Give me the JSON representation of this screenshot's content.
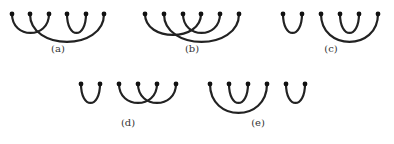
{
  "diagrams": [
    {
      "label": "(a)",
      "dots_x": [
        12,
        30,
        49,
        67,
        86,
        104
      ],
      "y": 14,
      "arcs": [
        [
          0,
          2,
          33
        ],
        [
          1,
          5,
          42
        ],
        [
          3,
          4,
          33
        ]
      ],
      "label_x": 58,
      "label_y": 50
    },
    {
      "label": "(b)",
      "dots_x": [
        145,
        164,
        183,
        201,
        220,
        239
      ],
      "y": 14,
      "arcs": [
        [
          0,
          3,
          35
        ],
        [
          2,
          4,
          33
        ],
        [
          1,
          5,
          42
        ]
      ],
      "label_x": 192,
      "label_y": 50
    },
    {
      "label": "(c)",
      "dots_x": [
        283,
        302,
        321,
        340,
        359,
        378
      ],
      "y": 14,
      "arcs": [
        [
          0,
          1,
          33
        ],
        [
          2,
          5,
          42
        ],
        [
          3,
          4,
          33
        ]
      ],
      "label_x": 331,
      "label_y": 50
    },
    {
      "label": "(d)",
      "dots_x": [
        81,
        100,
        119,
        138,
        157,
        176
      ],
      "y": 84,
      "arcs": [
        [
          0,
          1,
          103
        ],
        [
          2,
          4,
          103
        ],
        [
          3,
          5,
          103
        ]
      ],
      "label_x": 128,
      "label_y": 124
    },
    {
      "label": "(e)",
      "dots_x": [
        210,
        229,
        248,
        267,
        286,
        305
      ],
      "y": 84,
      "arcs": [
        [
          0,
          3,
          113
        ],
        [
          1,
          2,
          103
        ],
        [
          4,
          5,
          103
        ]
      ],
      "label_x": 258,
      "label_y": 124
    }
  ],
  "style": {
    "stroke": "#222222",
    "dot": "#111111"
  }
}
